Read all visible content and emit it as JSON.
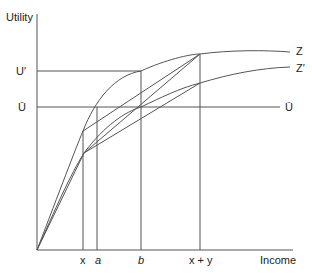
{
  "axes": {
    "y_label": "Utility",
    "x_label": "Income"
  },
  "y_ticks": {
    "u_prime": "U′",
    "u_bar": "Ū"
  },
  "x_ticks": {
    "x": "x",
    "a": "a",
    "b": "b",
    "x_plus_y": "x + y"
  },
  "curves": {
    "z": "Z",
    "z_prime": "Z′",
    "u_bar_line": "Ū"
  },
  "colors": {
    "line": "#555555",
    "text": "#222222"
  }
}
